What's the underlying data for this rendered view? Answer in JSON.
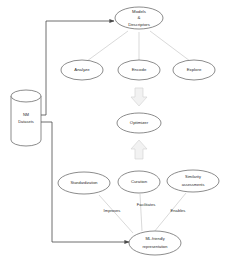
{
  "diagram": {
    "type": "flow-diagram",
    "background_color": "#ffffff",
    "colors": {
      "node_stroke": "#5a5a5a",
      "light_edge": "#c8c8c8",
      "dark_edge": "#4a4a4a",
      "block_arrow_fill": "#f2f2f2",
      "block_arrow_stroke": "#d6d6d6",
      "text": "#2b2b2b"
    },
    "datastore": {
      "label_line1": "NM",
      "label_line2": "Datasets"
    },
    "top_node": {
      "line1": "Models",
      "line2": "&",
      "line3": "Descriptors"
    },
    "task_nodes": [
      {
        "label": "Analyze"
      },
      {
        "label": "Encode"
      },
      {
        "label": "Explore"
      }
    ],
    "optimizer_node": {
      "label": "Optimizer"
    },
    "process_nodes": [
      {
        "label": "Standardization"
      },
      {
        "label": "Curation"
      },
      {
        "line1": "Similarity",
        "line2": "assessments"
      }
    ],
    "edge_labels": [
      {
        "label": "Improves"
      },
      {
        "label": "Facilitates"
      },
      {
        "label": "Enables"
      }
    ],
    "output_node": {
      "line1": "ML-friendly",
      "line2": "representation"
    },
    "block_arrows": [
      {
        "direction": "down"
      },
      {
        "direction": "up"
      }
    ]
  }
}
